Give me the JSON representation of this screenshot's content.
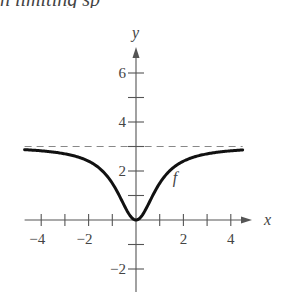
{
  "caption": "n limiting sp",
  "chart_data": {
    "type": "line",
    "title": "",
    "xlabel": "x",
    "ylabel": "y",
    "xlim": [
      -4.7,
      4.7
    ],
    "ylim": [
      -2.9,
      7.2
    ],
    "grid": false,
    "legend": "none",
    "x_ticks": [
      -4,
      -3,
      -2,
      -1,
      1,
      2,
      3,
      4
    ],
    "x_tick_labels": [
      {
        "value": -4,
        "label": "−4"
      },
      {
        "value": -2,
        "label": "−2"
      },
      {
        "value": 2,
        "label": "2"
      },
      {
        "value": 4,
        "label": "4"
      }
    ],
    "y_ticks": [
      -2,
      -1,
      1,
      2,
      3,
      4,
      5,
      6
    ],
    "y_tick_labels": [
      {
        "value": 6,
        "label": "6"
      },
      {
        "value": 4,
        "label": "4"
      },
      {
        "value": 2,
        "label": "2"
      },
      {
        "value": -2,
        "label": "−2"
      }
    ],
    "series": [
      {
        "name": "f",
        "label": "f",
        "label_position": {
          "x": 1.55,
          "y": 1.5
        },
        "formula": "3x^2/(x^2+1)",
        "x": [
          -4.7,
          -4,
          -3,
          -2,
          -1.5,
          -1,
          -0.5,
          0,
          0.5,
          1,
          1.5,
          2,
          3,
          4,
          4.5
        ],
        "values": [
          2.87,
          2.82,
          2.7,
          2.4,
          2.08,
          1.5,
          0.6,
          0,
          0.6,
          1.5,
          2.08,
          2.4,
          2.7,
          2.82,
          2.86
        ]
      }
    ],
    "annotations": [
      {
        "type": "horizontal_asymptote",
        "y": 3,
        "style": "dashed",
        "x_range": [
          -4.7,
          4.5
        ]
      }
    ]
  },
  "colors": {
    "axis": "#555555",
    "curve": "#111111",
    "asymptote": "#888888",
    "text": "#444444"
  }
}
